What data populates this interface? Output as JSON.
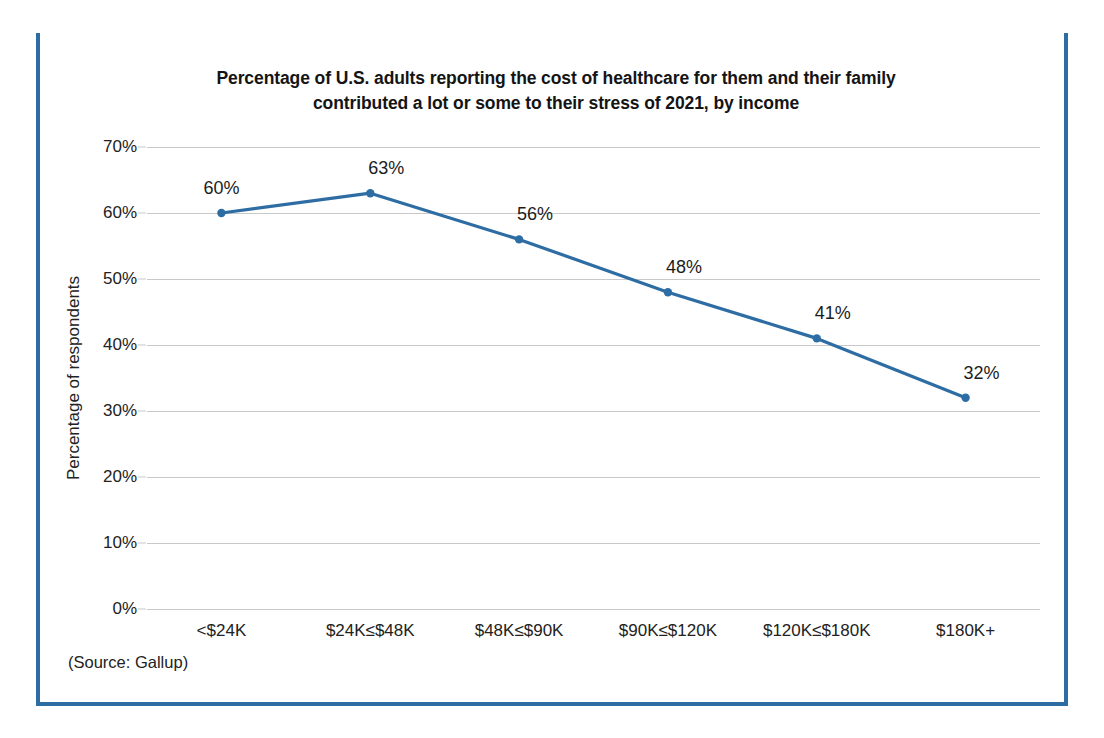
{
  "frame": {
    "border_color": "#2E6DA4"
  },
  "source_note": "(Source: Gallup)",
  "chart_data": {
    "type": "line",
    "title_line1": "Percentage of U.S. adults reporting the cost of healthcare for them and their family",
    "title_line2": "contributed a lot or some to their stress of 2021, by income",
    "categories": [
      "<$24K",
      "$24K≤$48K",
      "$48K≤$90K",
      "$90K≤$120K",
      "$120K≤$180K",
      "$180K+"
    ],
    "values": [
      60,
      63,
      56,
      48,
      41,
      32
    ],
    "point_labels": [
      "60%",
      "63%",
      "56%",
      "48%",
      "41%",
      "32%"
    ],
    "xlabel": "",
    "ylabel": "Percentage of respondents",
    "ylim": [
      0,
      70
    ],
    "ytick_values": [
      0,
      10,
      20,
      30,
      40,
      50,
      60,
      70
    ],
    "ytick_labels": [
      "0%",
      "10%",
      "20%",
      "30%",
      "40%",
      "50%",
      "60%",
      "70%"
    ],
    "grid": true,
    "legend": "none",
    "series_color": "#2E6DA4",
    "marker": "circle",
    "gridline_color": "#c9c9c9"
  }
}
